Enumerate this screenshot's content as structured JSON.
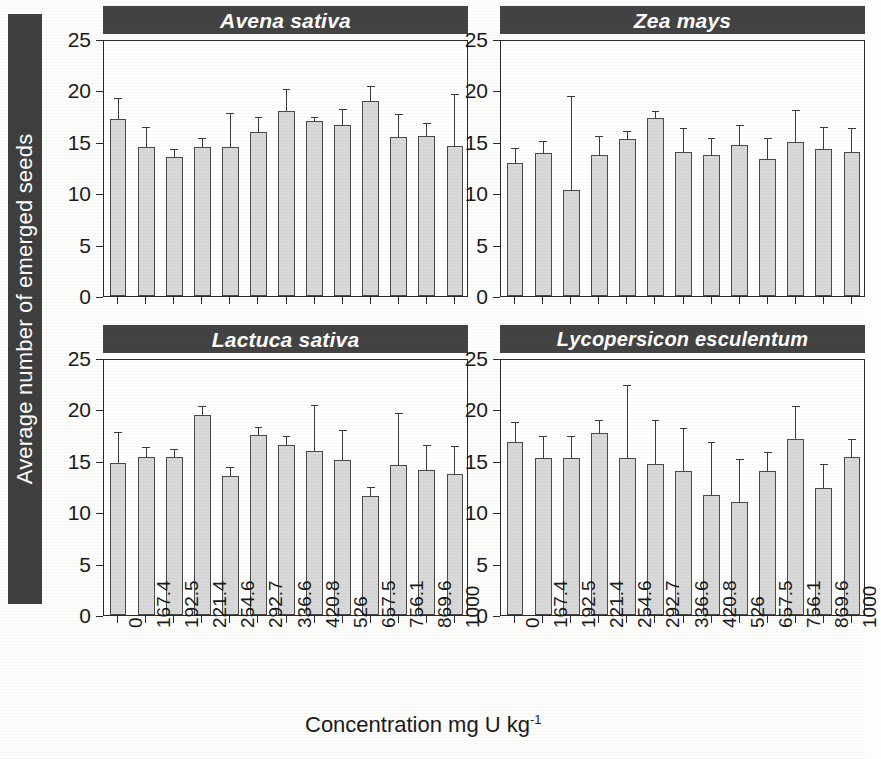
{
  "axes": {
    "ylabel": "Average number of emerged seeds",
    "xlabel_main": "Concentration mg U kg",
    "xlabel_exponent": "-1",
    "yticks": [
      "0",
      "5",
      "10",
      "15",
      "20",
      "25"
    ]
  },
  "panels": [
    {
      "title": "Avena sativa"
    },
    {
      "title": "Zea mays"
    },
    {
      "title": "Lactuca sativa"
    },
    {
      "title": "Lycopersicon esculentum"
    }
  ],
  "chart_data": {
    "type": "bar",
    "title": "",
    "xlabel": "Concentration mg U kg-1",
    "ylabel": "Average number of emerged seeds",
    "ylim": [
      0,
      25
    ],
    "ytick_values": [
      0,
      5,
      10,
      15,
      20,
      25
    ],
    "grid": false,
    "legend": "none",
    "error_bars": "upper only (SD), capped",
    "bar_color": "#d8d8d8",
    "bar_edge_color": "#4a4a4a",
    "panel_title_bg": "#434343",
    "panel_title_color": "#ffffff",
    "categories": [
      "0",
      "167.4",
      "192.5",
      "221.4",
      "254.6",
      "292.7",
      "336.6",
      "420.8",
      "526",
      "657.5",
      "756.1",
      "869.6",
      "1000"
    ],
    "panels": [
      {
        "name": "Avena sativa",
        "values": [
          17.2,
          14.5,
          13.5,
          14.5,
          14.5,
          16.0,
          18.0,
          17.0,
          16.6,
          19.0,
          15.5,
          15.6,
          14.6
        ],
        "errors_upper": [
          2.0,
          1.8,
          0.7,
          0.8,
          3.2,
          1.3,
          2.0,
          0.3,
          1.5,
          1.3,
          2.1,
          1.1,
          5.0
        ]
      },
      {
        "name": "Zea mays",
        "values": [
          12.9,
          13.9,
          10.3,
          13.7,
          15.3,
          17.3,
          14.0,
          13.7,
          14.7,
          13.3,
          15.0,
          14.3,
          14.0
        ],
        "errors_upper": [
          1.4,
          1.1,
          9.1,
          1.8,
          0.7,
          0.6,
          2.2,
          1.6,
          1.8,
          2.0,
          3.0,
          2.0,
          2.2
        ]
      },
      {
        "name": "Lactuca sativa",
        "values": [
          14.8,
          15.4,
          15.4,
          19.5,
          13.5,
          17.5,
          16.5,
          16.0,
          15.1,
          11.6,
          14.6,
          14.1,
          13.7
        ],
        "errors_upper": [
          2.9,
          0.8,
          0.7,
          0.7,
          0.8,
          0.7,
          0.8,
          4.3,
          2.8,
          0.8,
          5.0,
          2.3,
          2.6
        ]
      },
      {
        "name": "Lycopersicon esculentum",
        "values": [
          16.8,
          15.3,
          15.3,
          17.7,
          15.3,
          14.7,
          14.0,
          11.7,
          11.0,
          14.0,
          17.1,
          12.4,
          15.4
        ],
        "errors_upper": [
          1.9,
          2.0,
          2.0,
          1.2,
          7.0,
          4.2,
          4.1,
          5.0,
          4.1,
          1.8,
          3.1,
          2.2,
          1.6
        ]
      }
    ]
  }
}
